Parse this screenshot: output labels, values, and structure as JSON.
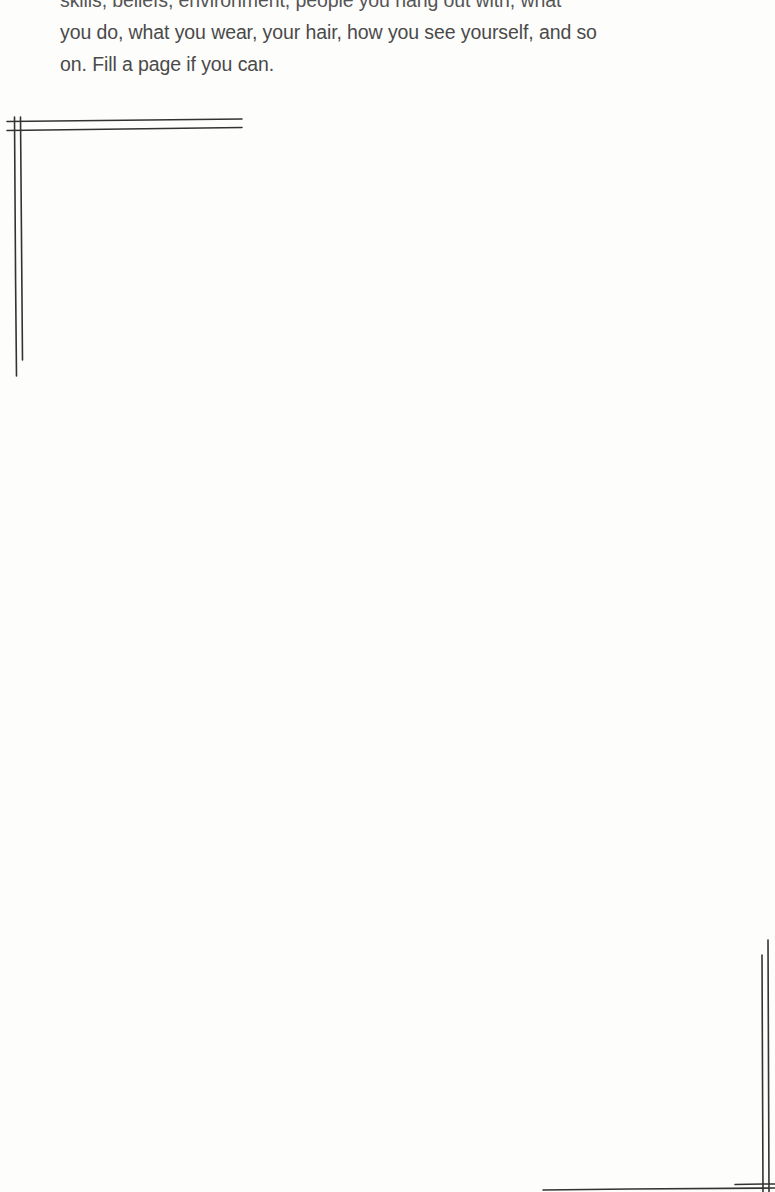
{
  "prompt": {
    "lines": [
      "skills, beliefs, environment, people you hang out with, what",
      "you do, what you wear, your hair, how you see yourself, and so",
      "on. Fill a page if you can."
    ]
  },
  "frame": {
    "style": "hand-drawn double-line corner brackets",
    "stroke_color": "#333333",
    "corners": [
      "top-left",
      "bottom-right"
    ]
  },
  "answer_area": {
    "value": ""
  }
}
